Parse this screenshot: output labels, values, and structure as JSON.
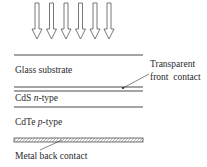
{
  "diagram": {
    "incident_light": {
      "arrow_count": 6,
      "direction": "down"
    },
    "layers": [
      {
        "name": "glass",
        "label": "Glass substrate"
      },
      {
        "name": "front-contact",
        "label_line1": "Transparent",
        "label_line2": "front  contact"
      },
      {
        "name": "cds",
        "label_prefix": "CdS ",
        "label_italic": "n",
        "label_suffix": "-type"
      },
      {
        "name": "cdte",
        "label_prefix": "CdTe ",
        "label_italic": "p",
        "label_suffix": "-type"
      },
      {
        "name": "metal",
        "label": "Metal back contact"
      }
    ],
    "colors": {
      "line": "#333333",
      "text": "#2a2a2a",
      "background": "#ffffff"
    }
  }
}
